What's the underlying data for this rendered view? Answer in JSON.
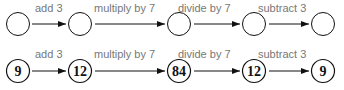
{
  "diagram": {
    "top_row": {
      "nodes": [
        "",
        "",
        "",
        "",
        ""
      ],
      "operations": [
        "add 3",
        "multiply by 7",
        "divide by 7",
        "subtract 3"
      ]
    },
    "bottom_row": {
      "nodes": [
        "9",
        "12",
        "84",
        "12",
        "9"
      ],
      "operations": [
        "add 3",
        "multiply by 7",
        "divide by 7",
        "subtract 3"
      ]
    },
    "colors": {
      "stroke": "#111111",
      "label": "#777777"
    }
  }
}
